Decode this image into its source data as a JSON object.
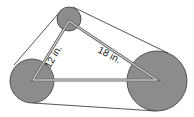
{
  "diagram": {
    "labels": {
      "left_side": "12 in.",
      "right_side": "18 in."
    },
    "colors": {
      "pulley_fill": "#8c8c8c",
      "pulley_stroke": "#3a3a3a",
      "belt_line": "#2a2a2a",
      "triangle_band": "#6e6e6e",
      "triangle_core": "#e8e8e8",
      "background": "#ffffff"
    },
    "pulleys": [
      {
        "name": "top",
        "cx": 69,
        "cy": 19,
        "r": 12
      },
      {
        "name": "left",
        "cx": 32,
        "cy": 81,
        "r": 22
      },
      {
        "name": "right",
        "cx": 157,
        "cy": 81,
        "r": 30
      }
    ]
  }
}
